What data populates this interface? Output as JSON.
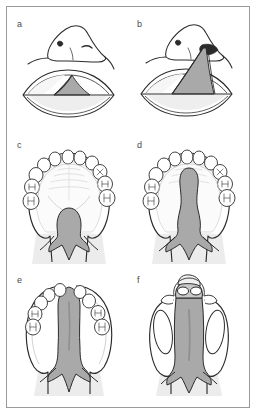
{
  "figure": {
    "caption_present": false,
    "frame_color": "#9a9a9a",
    "background_color": "#ffffff",
    "panel_count": 6
  },
  "style": {
    "line_color": "#2b2b2b",
    "cleft_gray": "#a9a9a9",
    "cleft_gray_dark": "#8f8f8f",
    "shadow_gray": "#d8d8d8",
    "tooth_fill": "#ffffff",
    "tooth_stroke": "#3a3a3a",
    "mucosa_tint": "#efefef",
    "label_color": "#4a4a4a"
  },
  "panels": [
    {
      "id": "a",
      "label": "a",
      "view": "frontal-face",
      "description": "Unilateral incomplete cleft lip with open mouth, nose intact"
    },
    {
      "id": "b",
      "label": "b",
      "view": "frontal-face",
      "description": "Unilateral complete cleft lip extending into nostril floor"
    },
    {
      "id": "c",
      "label": "c",
      "view": "palatal",
      "description": "Cleft of soft palate and posterior hard palate, intact alveolar arch",
      "teeth_left": 5,
      "teeth_right": 5
    },
    {
      "id": "d",
      "label": "d",
      "view": "palatal",
      "description": "Cleft extending forward through hard palate to incisive foramen",
      "teeth_left": 5,
      "teeth_right": 5
    },
    {
      "id": "e",
      "label": "e",
      "view": "palatal",
      "description": "Unilateral complete cleft lip and palate with separated alveolar segments",
      "teeth_left": 5,
      "teeth_right": 4
    },
    {
      "id": "f",
      "label": "f",
      "view": "palatal",
      "description": "Bilateral complete cleft lip and palate with protruding premaxilla",
      "teeth_premaxilla": 2
    }
  ]
}
